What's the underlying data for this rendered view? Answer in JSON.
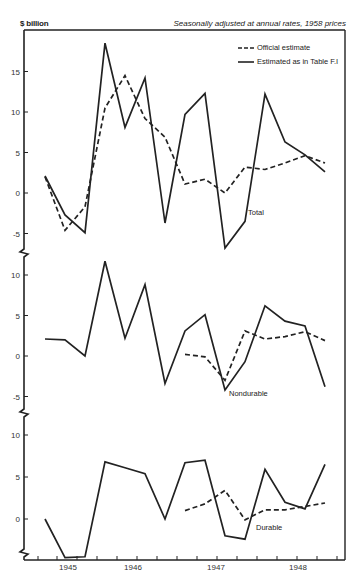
{
  "header": {
    "unit_label": "$ billion",
    "note": "Seasonally adjusted at annual rates, 1958 prices"
  },
  "legend": {
    "official": "Official estimate",
    "estimated": "Estimated as in Table F.I"
  },
  "chart_data": {
    "type": "line",
    "title": "",
    "subtitle": "Seasonally adjusted at annual rates, 1958 prices",
    "ylabel": "$ billion",
    "xlabel": "",
    "x_tick_labels": [
      "1945",
      "1946",
      "1947",
      "1948"
    ],
    "legend_position": "top-right",
    "grid": false,
    "x": [
      "1944Q4",
      "1945Q1",
      "1945Q2",
      "1945Q3",
      "1945Q4",
      "1946Q1",
      "1946Q2",
      "1946Q3",
      "1946Q4",
      "1947Q1",
      "1947Q2",
      "1947Q3",
      "1947Q4",
      "1948Q1",
      "1948Q2"
    ],
    "panels": [
      {
        "name": "Total",
        "y_ticks": [
          15,
          10,
          5,
          0,
          -5
        ],
        "ylim": [
          -7,
          19
        ],
        "series": [
          {
            "name": "Official estimate",
            "style": "dashed",
            "values": [
              2.0,
              -4.6,
              -1.7,
              10.5,
              14.5,
              9.2,
              6.9,
              1.1,
              1.7,
              0.0,
              3.2,
              2.9,
              3.7,
              4.6,
              3.7
            ]
          },
          {
            "name": "Estimated as in Table F.I",
            "style": "solid",
            "values": [
              2.1,
              -2.7,
              -4.9,
              18.5,
              8.1,
              14.2,
              -3.7,
              9.7,
              12.3,
              -6.8,
              -3.5,
              12.2,
              6.3,
              4.7,
              2.6
            ]
          }
        ]
      },
      {
        "name": "Nondurable",
        "y_ticks": [
          10,
          5,
          0,
          -5
        ],
        "ylim": [
          -6,
          12
        ],
        "series": [
          {
            "name": "Official estimate",
            "style": "dashed",
            "values": [
              null,
              null,
              null,
              null,
              null,
              null,
              null,
              0.2,
              -0.1,
              -3.0,
              3.1,
              2.1,
              2.4,
              3.0,
              1.9
            ]
          },
          {
            "name": "Estimated as in Table F.I",
            "style": "solid",
            "values": [
              2.1,
              2.0,
              0.0,
              11.7,
              2.2,
              8.8,
              -3.4,
              3.1,
              5.1,
              -4.2,
              -0.7,
              6.2,
              4.3,
              3.7,
              -3.8
            ]
          }
        ]
      },
      {
        "name": "Durable",
        "y_ticks": [
          10,
          5,
          0
        ],
        "ylim": [
          -4.8,
          12
        ],
        "series": [
          {
            "name": "Official estimate",
            "style": "dashed",
            "values": [
              null,
              null,
              null,
              null,
              null,
              null,
              null,
              1.0,
              1.8,
              3.4,
              -0.1,
              1.1,
              1.1,
              1.5,
              1.9
            ]
          },
          {
            "name": "Estimated as in Table F.I",
            "style": "solid",
            "values": [
              0.0,
              -4.6,
              -4.5,
              6.8,
              6.1,
              5.4,
              0.0,
              6.7,
              7.0,
              -2.0,
              -2.4,
              5.9,
              2.0,
              1.2,
              6.5
            ]
          }
        ]
      }
    ]
  },
  "layout": {
    "frame": {
      "left": 24,
      "top": 30,
      "right": 345,
      "bottom": 560
    },
    "x0": 45,
    "dx": 20,
    "x_tick_positions": [
      38,
      57,
      77,
      97,
      117,
      137,
      157,
      177,
      197,
      217,
      237,
      257,
      277,
      297,
      317,
      337
    ],
    "x_label_positions": [
      68,
      133,
      216,
      298
    ],
    "panels": [
      {
        "zero_y": 193,
        "px_per_unit": 8.1,
        "label_xy": [
          248,
          215
        ],
        "break_y": 253
      },
      {
        "zero_y": 356,
        "px_per_unit": 8.1,
        "label_xy": [
          229,
          396
        ],
        "break_y": 413
      },
      {
        "zero_y": 519,
        "px_per_unit": 8.4,
        "label_xy": [
          256,
          530
        ],
        "break_y": 553
      }
    ]
  }
}
